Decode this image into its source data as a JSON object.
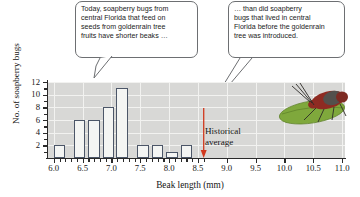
{
  "callouts": {
    "left": {
      "name": "callout-left",
      "lines": [
        "Today, soapberry bugs from",
        "central Florida that feed on",
        "seeds from goldenrain tree",
        "fruits have shorter beaks …"
      ]
    },
    "right": {
      "name": "callout-right",
      "lines": [
        "… than did soapberry",
        "bugs that lived in central",
        "Florida before the goldenrain",
        "tree was introduced."
      ]
    }
  },
  "annotation": {
    "historical_average_line1": "Historical",
    "historical_average_line2": "average",
    "historical_average_x": 8.6,
    "arrow_color": "#d1381d"
  },
  "photo": {
    "name": "soapberry-bug-on-leaf",
    "leaf_color": "#7fa83c",
    "bug_color": "#8e2b22"
  },
  "chart_data": {
    "type": "bar",
    "title": "",
    "xlabel": "Beak length (mm)",
    "ylabel": "No. of soapberry bugs",
    "xlim": [
      5.9,
      11.05
    ],
    "ylim": [
      0,
      12
    ],
    "grid": true,
    "legend": "none",
    "bin_width": 0.2,
    "bar_face_color": "#f4f5f3",
    "bar_edge_color": "#4c5668",
    "plot_background": "#d8d8d6",
    "gridline_color": "#f2f2f0",
    "xticks": [
      6.0,
      6.5,
      7.0,
      7.5,
      8.0,
      8.5,
      9.0,
      9.5,
      10.0,
      10.5,
      11.0
    ],
    "xticklabels": [
      "6.0",
      "6.5",
      "7.0",
      "7.5",
      "8.0",
      "8.5",
      "9.0",
      "9.5",
      "10.0",
      "10.5",
      "11.0"
    ],
    "yticks": [
      2,
      4,
      6,
      8,
      10,
      12
    ],
    "yticklabels": [
      "2",
      "4",
      "6",
      "8",
      "10",
      "12"
    ],
    "bins": [
      {
        "x_left": 6.0,
        "x_right": 6.2,
        "count": 2
      },
      {
        "x_left": 6.35,
        "x_right": 6.55,
        "count": 6
      },
      {
        "x_left": 6.6,
        "x_right": 6.8,
        "count": 6
      },
      {
        "x_left": 6.85,
        "x_right": 7.05,
        "count": 8
      },
      {
        "x_left": 7.08,
        "x_right": 7.28,
        "count": 11
      },
      {
        "x_left": 7.45,
        "x_right": 7.65,
        "count": 2
      },
      {
        "x_left": 7.7,
        "x_right": 7.9,
        "count": 2
      },
      {
        "x_left": 7.95,
        "x_right": 8.15,
        "count": 1
      },
      {
        "x_left": 8.2,
        "x_right": 8.4,
        "count": 2
      }
    ],
    "categories": [
      "6.0-6.2",
      "6.35-6.55",
      "6.6-6.8",
      "6.85-7.05",
      "7.08-7.28",
      "7.45-7.65",
      "7.7-7.9",
      "7.95-8.15",
      "8.2-8.4"
    ],
    "values": [
      2,
      6,
      6,
      8,
      11,
      2,
      2,
      1,
      2
    ]
  }
}
